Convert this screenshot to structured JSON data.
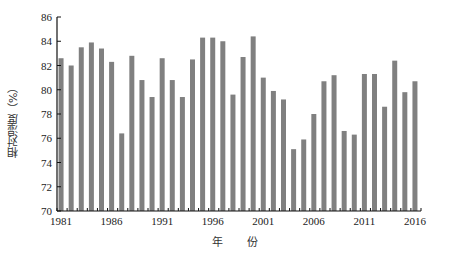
{
  "chart_data": {
    "type": "bar",
    "title": "",
    "xlabel": "年 份",
    "ylabel": "相对湿度（%）",
    "ylim": [
      70,
      86
    ],
    "yticks": [
      70,
      72,
      74,
      76,
      78,
      80,
      82,
      84,
      86
    ],
    "xtick_labels": [
      "1981",
      "1986",
      "1991",
      "1996",
      "2001",
      "2006",
      "2011",
      "2016"
    ],
    "grid": false,
    "legend": null,
    "bar_color": "#808080",
    "categories": [
      "1981",
      "1982",
      "1983",
      "1984",
      "1985",
      "1986",
      "1987",
      "1988",
      "1989",
      "1990",
      "1991",
      "1992",
      "1993",
      "1994",
      "1995",
      "1996",
      "1997",
      "1998",
      "1999",
      "2000",
      "2001",
      "2002",
      "2003",
      "2004",
      "2005",
      "2006",
      "2007",
      "2008",
      "2009",
      "2010",
      "2011",
      "2012",
      "2013",
      "2014",
      "2015",
      "2016"
    ],
    "values": [
      82.6,
      82.0,
      83.5,
      83.9,
      83.4,
      82.3,
      76.4,
      82.8,
      80.8,
      79.4,
      82.6,
      80.8,
      79.4,
      82.5,
      84.3,
      84.3,
      84.0,
      79.6,
      82.7,
      84.4,
      81.0,
      79.9,
      79.2,
      75.1,
      75.9,
      78.0,
      80.7,
      81.2,
      76.6,
      76.3,
      81.3,
      81.3,
      78.6,
      82.4,
      79.8,
      80.7
    ]
  }
}
